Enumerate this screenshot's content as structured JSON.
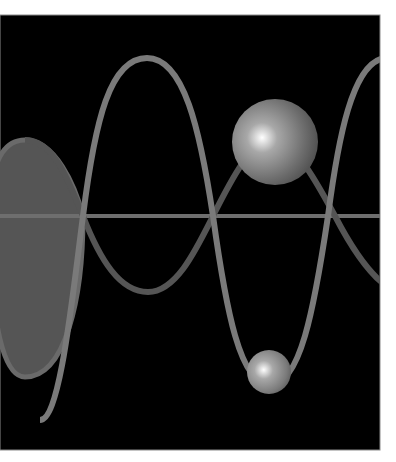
{
  "figure": {
    "background": "#ffffff",
    "panel": {
      "x": 0,
      "y": 15,
      "width": 380,
      "height": 435,
      "fill": "#000000",
      "border": "#8a8a8a"
    },
    "axis": {
      "y": 216,
      "color": "#6e6e6e",
      "width": 4
    },
    "colors": {
      "curve_a": "#7a7a7a",
      "curve_b": "#555555",
      "lobe_fill": "#555555",
      "lobe_edge": "#6e6e6e",
      "sphere_highlight": "#ffffff",
      "sphere_mid": "#9a9a9a",
      "sphere_dark": "#4a4a4a"
    },
    "spheres": [
      {
        "name": "large-sphere",
        "cx": 275,
        "cy": 142,
        "r": 43
      },
      {
        "name": "small-sphere",
        "cx": 269,
        "cy": 372,
        "r": 22
      }
    ]
  }
}
